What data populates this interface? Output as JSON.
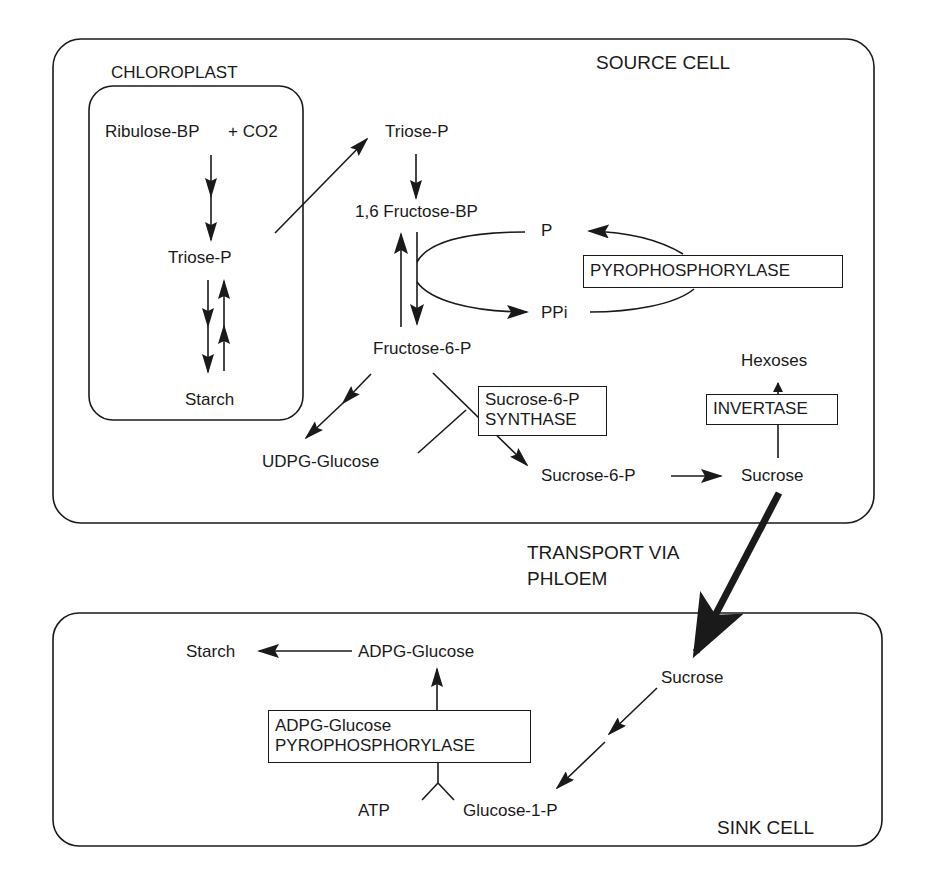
{
  "compartments": {
    "source_cell": "SOURCE CELL",
    "chloroplast": "CHLOROPLAST",
    "sink_cell": "SINK CELL"
  },
  "chloroplast": {
    "ribulose": "Ribulose-BP",
    "co2": "+ CO2",
    "triose": "Triose-P",
    "starch": "Starch"
  },
  "cytosol": {
    "triose": "Triose-P",
    "fructose_bp": "1,6 Fructose-BP",
    "p": "P",
    "ppi": "PPi",
    "fructose_6p": "Fructose-6-P",
    "udpg": "UDPG-Glucose",
    "sucrose_6p": "Sucrose-6-P",
    "sucrose": "Sucrose",
    "hexoses": "Hexoses"
  },
  "enzymes": {
    "pyrophosphorylase": "PYROPHOSPHORYLASE",
    "sucrose_synthase": [
      "Sucrose-6-P",
      "SYNTHASE"
    ],
    "invertase": "INVERTASE",
    "adpg_pyrophosphorylase": [
      "ADPG-Glucose",
      "PYROPHOSPHORYLASE"
    ]
  },
  "transport": [
    "TRANSPORT VIA",
    "PHLOEM"
  ],
  "sink": {
    "starch": "Starch",
    "adpg": "ADPG-Glucose",
    "sucrose": "Sucrose",
    "atp": "ATP",
    "glucose_1p": "Glucose-1-P"
  },
  "colors": {
    "ink": "#1a1a1a",
    "background": "#ffffff"
  }
}
